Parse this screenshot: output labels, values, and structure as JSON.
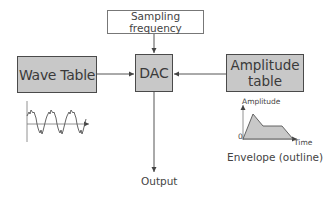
{
  "diagram": {
    "nodes": {
      "sampling_frequency": "Sampling frequency",
      "dac": "DAC",
      "wave_table": "Wave Table",
      "amplitude_table_line1": "Amplitude",
      "amplitude_table_line2": "table",
      "output": "Output"
    },
    "edges": [
      {
        "from": "Sampling frequency",
        "to": "DAC"
      },
      {
        "from": "Wave Table",
        "to": "DAC"
      },
      {
        "from": "Amplitude table",
        "to": "DAC"
      },
      {
        "from": "DAC",
        "to": "Output"
      }
    ],
    "envelope_graph": {
      "y_axis_label": "Amplitude",
      "x_axis_label": "Time",
      "origin_label": "0",
      "caption": "Envelope (outline)",
      "shape": "ADSR",
      "fill_color": "#c8c8c8"
    },
    "wave_graph": {
      "description": "periodic waveform with harmonics, 3 cycles"
    },
    "colors": {
      "box_fill": "#c8c8c8",
      "box_border": "#4a4a4a",
      "line": "#555555",
      "text": "#3a3a3a"
    }
  }
}
